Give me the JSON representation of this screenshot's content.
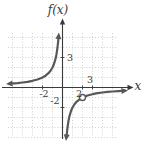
{
  "figure": {
    "y_axis_title": "f(x)",
    "x_axis_label": "x",
    "ticks": {
      "y3": "3",
      "ym2": "-2",
      "xm2": "-2",
      "x2": "2",
      "x3": "3"
    }
  },
  "colors": {
    "background": "#ffffff",
    "grid": "#c0c6c0",
    "axis": "#3a3a3a",
    "curve": "#585858",
    "text": "#3a3a3a",
    "hole_fill": "#ffffff"
  },
  "chart_data": {
    "type": "line",
    "title": "",
    "xlabel": "x",
    "ylabel": "f(x)",
    "xlim": [
      -5.5,
      7
    ],
    "ylim": [
      -5.5,
      6.8
    ],
    "grid": true,
    "grid_step": 1,
    "tick_labels": [
      {
        "axis": "y",
        "value": 3,
        "text": "3"
      },
      {
        "axis": "y",
        "value": -2,
        "text": "-2"
      },
      {
        "axis": "x",
        "value": -2,
        "text": "-2"
      },
      {
        "axis": "x",
        "value": 2,
        "text": "2"
      },
      {
        "axis": "x",
        "value": 3,
        "text": "3"
      }
    ],
    "open_point": {
      "x": 2,
      "y": -1
    },
    "series": [
      {
        "name": "branch-upper-left",
        "arrows": [
          "start",
          "end"
        ],
        "points": [
          [
            -5.3,
            0.38
          ],
          [
            -4.5,
            0.44
          ],
          [
            -4,
            0.5
          ],
          [
            -3.5,
            0.57
          ],
          [
            -3,
            0.67
          ],
          [
            -2.5,
            0.8
          ],
          [
            -2,
            1
          ],
          [
            -1.7,
            1.18
          ],
          [
            -1.4,
            1.43
          ],
          [
            -1.2,
            1.67
          ],
          [
            -1,
            2
          ],
          [
            -0.85,
            2.35
          ],
          [
            -0.7,
            2.86
          ],
          [
            -0.6,
            3.33
          ],
          [
            -0.5,
            4
          ],
          [
            -0.44,
            4.55
          ],
          [
            -0.39,
            5.15
          ]
        ]
      },
      {
        "name": "branch-lower-right",
        "arrows": [
          "start",
          "end"
        ],
        "points": [
          [
            0.39,
            -5.0
          ],
          [
            0.44,
            -4.55
          ],
          [
            0.5,
            -4
          ],
          [
            0.6,
            -3.33
          ],
          [
            0.7,
            -2.86
          ],
          [
            0.85,
            -2.35
          ],
          [
            1,
            -2
          ],
          [
            1.2,
            -1.67
          ],
          [
            1.4,
            -1.43
          ],
          [
            1.7,
            -1.18
          ],
          [
            2,
            -1
          ],
          [
            2.5,
            -0.8
          ],
          [
            3,
            -0.67
          ],
          [
            3.5,
            -0.57
          ],
          [
            4,
            -0.5
          ],
          [
            4.5,
            -0.44
          ],
          [
            5,
            -0.4
          ],
          [
            5.6,
            -0.36
          ],
          [
            6.2,
            -0.32
          ]
        ]
      }
    ]
  }
}
